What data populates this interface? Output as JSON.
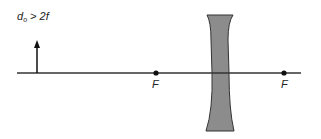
{
  "diagram": {
    "type": "optics-ray-diagram",
    "lens": "diverging (concave) lens",
    "condition": {
      "variable": "d",
      "subscript": "o",
      "relation": ">",
      "value": "2f"
    },
    "object": {
      "kind": "upright arrow",
      "position": "beyond 2F, left of lens"
    },
    "focal_points": [
      {
        "label": "F",
        "side": "left"
      },
      {
        "label": "F",
        "side": "right"
      }
    ],
    "colors": {
      "axis": "#333333",
      "lens_fill": "#8c8c8c",
      "lens_stroke": "#333333",
      "object": "#111111",
      "text": "#222222"
    }
  }
}
